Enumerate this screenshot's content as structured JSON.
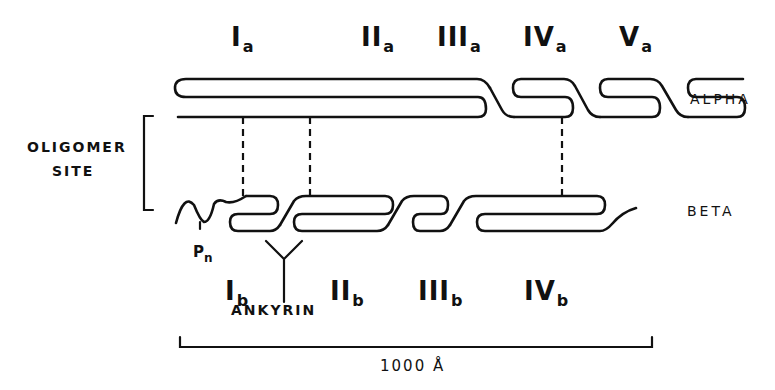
{
  "diagram": {
    "type": "protein domain schematic",
    "chains": [
      {
        "name": "ALPHA",
        "domains": [
          "Ia",
          "IIa",
          "IIIa",
          "IVa",
          "Va"
        ]
      },
      {
        "name": "BETA",
        "domains": [
          "Ib",
          "IIb",
          "IIIb",
          "IVb"
        ]
      }
    ],
    "alpha_domains": [
      {
        "roman": "I",
        "sub": "a"
      },
      {
        "roman": "II",
        "sub": "a"
      },
      {
        "roman": "III",
        "sub": "a"
      },
      {
        "roman": "IV",
        "sub": "a"
      },
      {
        "roman": "V",
        "sub": "a"
      }
    ],
    "beta_domains": [
      {
        "roman": "I",
        "sub": "b"
      },
      {
        "roman": "II",
        "sub": "b"
      },
      {
        "roman": "III",
        "sub": "b"
      },
      {
        "roman": "IV",
        "sub": "b"
      }
    ],
    "labels": {
      "alpha": "ALPHA",
      "beta": "BETA",
      "oligomer_line1": "OLIGOMER",
      "oligomer_line2": "SITE",
      "ankyrin": "ANKYRIN",
      "phospho": "P",
      "phospho_sub": "n",
      "scale": "1000 Å"
    },
    "connections": [
      {
        "from": "alpha N-terminus",
        "to": "Ib",
        "style": "dashed"
      },
      {
        "from": "alpha N-terminus",
        "to": "IIb",
        "style": "dashed"
      },
      {
        "from": "IVa",
        "to": "IVb",
        "style": "dashed"
      }
    ]
  }
}
